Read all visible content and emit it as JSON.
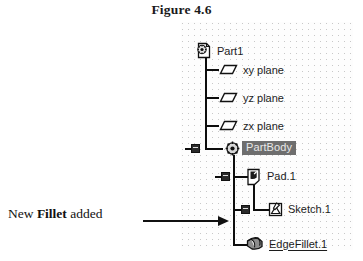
{
  "figure": {
    "title": "Figure 4.6"
  },
  "annotation": {
    "prefix": "New ",
    "emphasis": "Fillet",
    "suffix": " added",
    "arrow_icon": "arrow-right-icon",
    "leader_icon": "leader-line"
  },
  "tree": {
    "panel_name": "specification-tree-panel",
    "background": "#fdfdfd",
    "grid_dot_color": "#c8c8c8",
    "selection_color": "#6e6e6e",
    "selection_text_color": "#e8e8e8",
    "line_color": "#0d0d0d",
    "nodes": [
      {
        "id": "part1",
        "label": "Part1",
        "icon": "part-document-icon",
        "depth": 0,
        "selected": false,
        "underlined": false,
        "expanded": true
      },
      {
        "id": "xy-plane",
        "label": "xy plane",
        "icon": "plane-icon",
        "depth": 1,
        "selected": false,
        "underlined": false,
        "expanded": false
      },
      {
        "id": "yz-plane",
        "label": "yz plane",
        "icon": "plane-icon",
        "depth": 1,
        "selected": false,
        "underlined": false,
        "expanded": false
      },
      {
        "id": "zx-plane",
        "label": "zx plane",
        "icon": "plane-icon",
        "depth": 1,
        "selected": false,
        "underlined": false,
        "expanded": false
      },
      {
        "id": "partbody",
        "label": "PartBody",
        "icon": "body-icon",
        "depth": 1,
        "selected": true,
        "underlined": false,
        "expanded": true
      },
      {
        "id": "pad1",
        "label": "Pad.1",
        "icon": "pad-icon",
        "depth": 2,
        "selected": false,
        "underlined": false,
        "expanded": true
      },
      {
        "id": "sketch1",
        "label": "Sketch.1",
        "icon": "sketch-icon",
        "depth": 3,
        "selected": false,
        "underlined": false,
        "expanded": false
      },
      {
        "id": "edgefillet1",
        "label": "EdgeFillet.1",
        "icon": "edge-fillet-icon",
        "depth": 2,
        "selected": false,
        "underlined": true,
        "expanded": false
      }
    ]
  }
}
